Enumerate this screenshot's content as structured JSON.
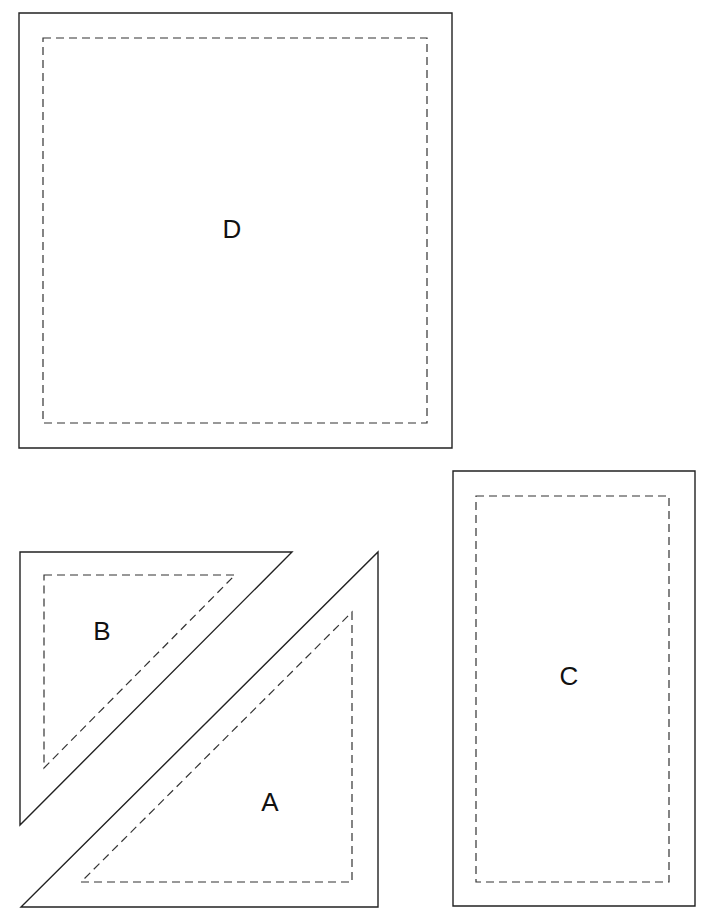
{
  "diagram": {
    "pieces": [
      {
        "id": "D",
        "label": "D",
        "shape": "square",
        "cut_line": [
          [
            19,
            13
          ],
          [
            452,
            13
          ],
          [
            452,
            448
          ],
          [
            19,
            448
          ]
        ],
        "seam_line": [
          [
            43,
            38
          ],
          [
            427,
            38
          ],
          [
            427,
            423
          ],
          [
            43,
            423
          ]
        ],
        "label_pos": [
          232,
          231
        ]
      },
      {
        "id": "B",
        "label": "B",
        "shape": "right-triangle",
        "cut_line": [
          [
            20,
            552
          ],
          [
            292,
            552
          ],
          [
            20,
            825
          ]
        ],
        "seam_line": [
          [
            44,
            575
          ],
          [
            235,
            575
          ],
          [
            44,
            768
          ]
        ],
        "label_pos": [
          102,
          633
        ]
      },
      {
        "id": "A",
        "label": "A",
        "shape": "right-triangle",
        "cut_line": [
          [
            378,
            552
          ],
          [
            378,
            907
          ],
          [
            21,
            907
          ]
        ],
        "seam_line": [
          [
            352,
            612
          ],
          [
            352,
            882
          ],
          [
            81,
            882
          ]
        ],
        "label_pos": [
          270,
          804
        ]
      },
      {
        "id": "C",
        "label": "C",
        "shape": "rectangle",
        "cut_line": [
          [
            453,
            471
          ],
          [
            695,
            471
          ],
          [
            695,
            906
          ],
          [
            453,
            906
          ]
        ],
        "seam_line": [
          [
            476,
            496
          ],
          [
            669,
            496
          ],
          [
            669,
            882
          ],
          [
            476,
            882
          ]
        ],
        "label_pos": [
          569,
          678
        ]
      }
    ],
    "colors": {
      "background": "#ffffff",
      "line": "#222222"
    }
  }
}
